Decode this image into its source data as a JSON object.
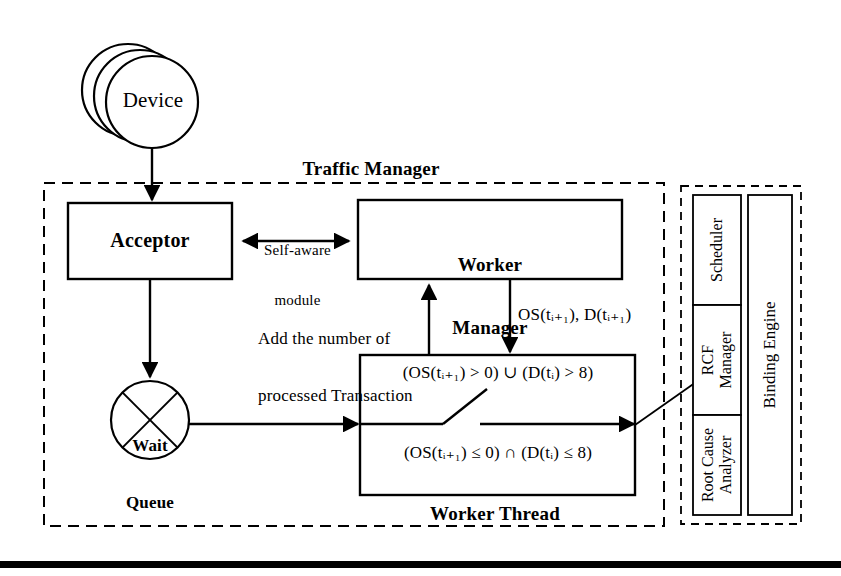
{
  "diagram": {
    "colors": {
      "stroke": "#000000",
      "background": "#ffffff",
      "dashed_border": "#000000",
      "bottom_bar": "#000000"
    },
    "device": {
      "label": "Device",
      "stack_count": 3
    },
    "traffic_manager": {
      "title": "Traffic Manager",
      "acceptor": {
        "label": "Acceptor"
      },
      "worker_manager": {
        "label": "Worker Manager",
        "line1": "Worker",
        "line2": "Manager"
      },
      "self_aware": {
        "line1": "Self-aware",
        "line2": "module"
      },
      "wait_queue": {
        "line1": "Wait",
        "line2": "Queue"
      },
      "add_transactions": {
        "line1": "Add the number of",
        "line2": "processed Transaction"
      },
      "metrics_label": "OS(tᵢ₊₁), D(tᵢ₊₁)",
      "metrics_parts": {
        "os": "OS(t",
        "os_sub": "i+1",
        "os_close": "), D(t",
        "d_sub": "i+1",
        "d_close": ")"
      },
      "worker_thread": {
        "title": "Worker Thread",
        "condition_true": "(OS(tᵢ₊₁) > 0) ∪ (D(tᵢ) > 8)",
        "condition_false": "(OS(tᵢ₊₁) ≤ 0) ∩ (D(tᵢ) ≤ 8)"
      }
    },
    "binding_engine": {
      "label": "Binding Engine",
      "modules": [
        {
          "id": "scheduler",
          "label": "Scheduler"
        },
        {
          "id": "rcf-manager",
          "label": "RCF Manager",
          "line1": "RCF",
          "line2": "Manager"
        },
        {
          "id": "root-cause-analyzer",
          "label": "Root Cause Analyzer",
          "line1": "Root Cause",
          "line2": "Analyzer"
        }
      ]
    }
  }
}
